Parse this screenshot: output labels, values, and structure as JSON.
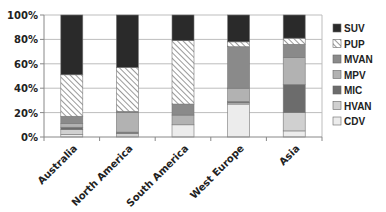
{
  "chart_data": {
    "type": "bar",
    "stacked": true,
    "percent": true,
    "title": "",
    "xlabel": "",
    "ylabel": "",
    "ylim": [
      0,
      100
    ],
    "yticks": [
      "0%",
      "20%",
      "40%",
      "60%",
      "80%",
      "100%"
    ],
    "ytick_values": [
      0,
      20,
      40,
      60,
      80,
      100
    ],
    "grid": true,
    "legend_position": "right",
    "categories": [
      "Australia",
      "North America",
      "South America",
      "West Europe",
      "Asia"
    ],
    "series": [
      {
        "name": "CDV",
        "color": "#ececec",
        "pattern": "solid",
        "values": [
          2,
          0,
          10,
          27,
          5
        ]
      },
      {
        "name": "HVAN",
        "color": "#d0d0d0",
        "pattern": "solid",
        "values": [
          4,
          3,
          0,
          1,
          15
        ]
      },
      {
        "name": "MIC",
        "color": "#6c6c6c",
        "pattern": "solid",
        "values": [
          2,
          1,
          0,
          1,
          23
        ]
      },
      {
        "name": "MPV",
        "color": "#b2b2b2",
        "pattern": "solid",
        "values": [
          3,
          16,
          8,
          11,
          22
        ]
      },
      {
        "name": "MVAN",
        "color": "#8a8a8a",
        "pattern": "solid",
        "values": [
          6,
          1,
          9,
          34,
          11
        ]
      },
      {
        "name": "PUP",
        "color": "#ffffff",
        "pattern": "hatch",
        "values": [
          34,
          36,
          52,
          4,
          5
        ]
      },
      {
        "name": "SUV",
        "color": "#2a2a2a",
        "pattern": "solid",
        "values": [
          49,
          43,
          21,
          22,
          19
        ]
      }
    ],
    "legend_order": [
      "SUV",
      "PUP",
      "MVAN",
      "MPV",
      "MIC",
      "HVAN",
      "CDV"
    ]
  }
}
